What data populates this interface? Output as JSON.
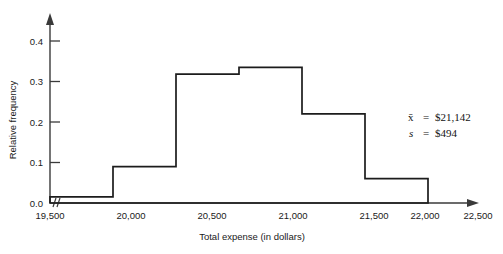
{
  "chart_data": {
    "type": "bar",
    "title": "",
    "xlabel": "Total expense (in dollars)",
    "ylabel": "Relative frequency",
    "categories": [
      "19,500-20,000",
      "20,000-20,500",
      "20,500-21,000",
      "21,000-21,500",
      "21,500-22,000",
      "22,000-22,500"
    ],
    "bin_edges": [
      19500,
      20000,
      20500,
      21000,
      21500,
      22000,
      22500
    ],
    "values": [
      0.015,
      0.09,
      0.318,
      0.335,
      0.22,
      0.06
    ],
    "xlim": [
      19500,
      22500
    ],
    "ylim": [
      0.0,
      0.44
    ],
    "xticks": [
      "19,500",
      "20,000",
      "20,500",
      "21,000",
      "21,500",
      "22,000",
      "22,500"
    ],
    "yticks": [
      "0.0",
      "0.1",
      "0.2",
      "0.3",
      "0.4"
    ],
    "ytick_values": [
      0.0,
      0.1,
      0.2,
      0.3,
      0.4
    ],
    "grid": false,
    "legend": null,
    "axis_break": true,
    "annotations": [
      {
        "symbol": "x̄",
        "equals": "=",
        "value": "$21,142"
      },
      {
        "symbol": "s",
        "equals": "=",
        "value": "$494"
      }
    ]
  },
  "colors": {
    "bar_stroke": "#1c1c1c",
    "axis": "#3a3a3a",
    "text": "#1a1a1a",
    "background": "#ffffff"
  }
}
